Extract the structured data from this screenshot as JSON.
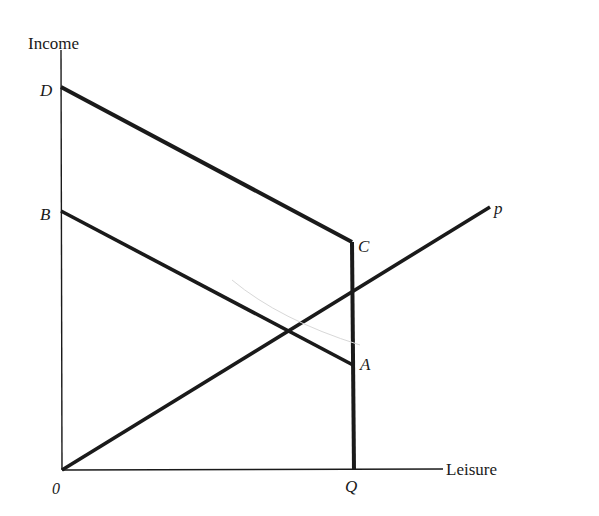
{
  "diagram": {
    "axes": {
      "y_label": "Income",
      "x_label": "Leisure",
      "origin_label": "0"
    },
    "points": {
      "D": "D",
      "B": "B",
      "C": "C",
      "A": "A",
      "Q": "Q",
      "p": "p"
    },
    "lines": [
      {
        "name": "budget-line-DC",
        "from": "D",
        "to": "C"
      },
      {
        "name": "budget-line-BA",
        "from": "B",
        "to": "A"
      },
      {
        "name": "vertical-segment-CQ",
        "from": "C",
        "to": "Q"
      },
      {
        "name": "ray-0p",
        "from": "0",
        "to": "p"
      }
    ],
    "colors": {
      "ink": "#1a1a1a",
      "background": "#ffffff"
    }
  }
}
